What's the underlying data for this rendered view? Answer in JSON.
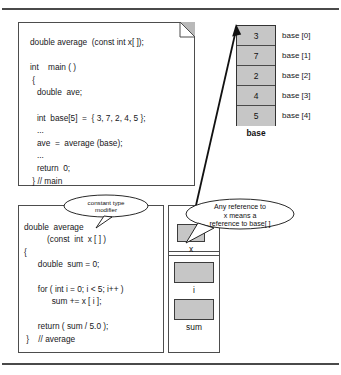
{
  "figure": {
    "colors": {
      "cell_fill": "#c6c6c6",
      "border": "#4d4d4d",
      "rule": "#4a4a4a",
      "text": "#17171a"
    }
  },
  "top_document": {
    "name": "main-function-code",
    "code": "double average  (const int x[ ]);\n\nint    main ( )\n {\n   double  ave;\n\n   int  base[5]  =  { 3, 7, 2, 4, 5 };\n   ...\n   ave  =  average (base);\n   ...\n   return  0;\n } // main"
  },
  "array": {
    "name": "base-array",
    "caption": "base",
    "cells": [
      {
        "value": "3",
        "index_label": "base [0]"
      },
      {
        "value": "7",
        "index_label": "base [1]"
      },
      {
        "value": "2",
        "index_label": "base [2]"
      },
      {
        "value": "4",
        "index_label": "base [3]"
      },
      {
        "value": "5",
        "index_label": "base [4]"
      }
    ]
  },
  "bottom_panel": {
    "name": "average-function-code",
    "code": "double  average\n          (const  int  x [ ] )\n{\n      double  sum = 0;\n\n      for ( int i = 0; i < 5; i++ )\n            sum += x [ i ];\n\n      return ( sum / 5.0 );\n }    // average"
  },
  "variables": [
    {
      "name": "x",
      "label": "x"
    },
    {
      "name": "i",
      "label": "i"
    },
    {
      "name": "sum",
      "label": "sum"
    }
  ],
  "callouts": [
    {
      "name": "constant-type-modifier",
      "text": "constant type\nmodifier"
    },
    {
      "name": "reference-to-base",
      "text": "Any reference to\nx  means a\nreference to base[ ]"
    }
  ]
}
